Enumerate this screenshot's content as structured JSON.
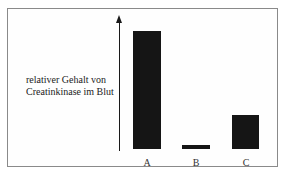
{
  "chart_data": {
    "type": "bar",
    "title": "",
    "xlabel": "",
    "ylabel": "relativer Gehalt von Creatinkinase im Blut",
    "ylabel_lines": [
      "relativer Gehalt von",
      "Creatinkinase im Blut"
    ],
    "categories": [
      "A",
      "B",
      "C"
    ],
    "values": [
      100,
      3,
      29
    ],
    "ylim": [
      0,
      110
    ],
    "grid": false,
    "legend": null,
    "y_axis": {
      "ticks": false,
      "arrow": true
    },
    "bar_color": "#151515"
  }
}
